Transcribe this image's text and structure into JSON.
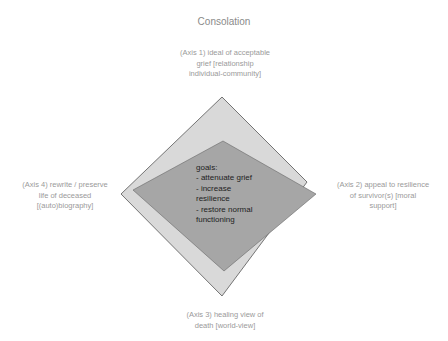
{
  "title": "Consolation",
  "axes": [
    {
      "id": "axis1",
      "lines": [
        "(Axis 1) ideal of acceptable",
        "grief [relationship",
        "individual-community]"
      ]
    },
    {
      "id": "axis2",
      "lines": [
        "(Axis 2) appeal to resilience",
        "of survivor(s) [moral",
        "support]"
      ]
    },
    {
      "id": "axis3",
      "lines": [
        "(Axis 3) healing view of",
        "death [world-view]"
      ]
    },
    {
      "id": "axis4",
      "lines": [
        "(Axis 4) rewrite / preserve",
        "life of deceased",
        "[(auto)biography]"
      ]
    }
  ],
  "goals": {
    "heading": "goals:",
    "items": [
      "- attenuate grief",
      "- increase",
      "resilience",
      "- restore normal",
      "functioning"
    ]
  },
  "colors": {
    "outer_fill": "#d9d9d9",
    "inner_fill": "#a6a6a6",
    "stroke": "#555555",
    "label_text": "#9a9a9a"
  }
}
